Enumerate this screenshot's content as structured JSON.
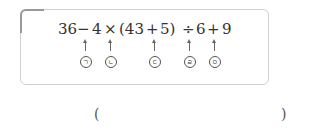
{
  "problem": {
    "expression_tokens": [
      "36",
      "−",
      "4",
      "×",
      "(43",
      "+",
      "5)",
      "÷",
      "6",
      "+",
      "9"
    ],
    "markers": [
      {
        "label": "ㄱ",
        "operator": "−"
      },
      {
        "label": "ㄴ",
        "operator": "×"
      },
      {
        "label": "ㄷ",
        "operator": "+"
      },
      {
        "label": "ㄹ",
        "operator": "÷"
      },
      {
        "label": "ㅁ",
        "operator": "+"
      }
    ]
  },
  "answer": {
    "open_paren": "(",
    "close_paren": ")",
    "value": ""
  }
}
